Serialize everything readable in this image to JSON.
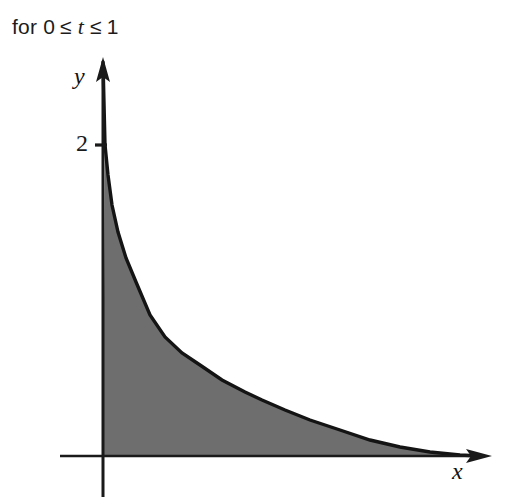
{
  "caption": {
    "prefix": "for 0",
    "rel1": "≤",
    "variable": "t",
    "rel2": "≤",
    "upper": "1",
    "full_text": "for 0 ≤ t ≤ 1"
  },
  "axes": {
    "y_label": "y",
    "x_label": "x",
    "y_tick_label": "2",
    "origin_px": [
      103,
      456
    ],
    "y_axis_top_px": 60,
    "y_axis_bottom_px": 497,
    "x_axis_right_px": 490,
    "y_tick_value": 2,
    "y_tick_px": 145
  },
  "colors": {
    "axis": "#1a1a1a",
    "curve": "#141414",
    "fill": "#6e6e6e",
    "background": "#ffffff",
    "text": "#1c1c1c"
  },
  "chart_data": {
    "type": "area",
    "title": "",
    "subtitle": "",
    "xlabel": "x",
    "ylabel": "y",
    "annotations": [
      "for 0 ≤ t ≤ 1"
    ],
    "grid": false,
    "legend": null,
    "y_ticks": [
      2
    ],
    "x_ticks": [],
    "shaded_region": true,
    "shade_color": "#6e6e6e",
    "curve_description": "decreasing convex hyperbolic-type curve from y=2 at x=0, asymptotic to the x-axis",
    "x": [
      0,
      0.08,
      0.16,
      0.25,
      0.35,
      0.45,
      0.6,
      0.75,
      0.95,
      1.2,
      1.5,
      1.9,
      2.4,
      3.0,
      3.7,
      4.5,
      5.4,
      6.4,
      7.5,
      8.7,
      10.0
    ],
    "y": [
      2.0,
      1.62,
      1.34,
      1.12,
      0.95,
      0.82,
      0.68,
      0.58,
      0.48,
      0.39,
      0.31,
      0.245,
      0.19,
      0.15,
      0.115,
      0.09,
      0.07,
      0.052,
      0.038,
      0.025,
      0.012
    ],
    "curve_points_px": [
      [
        105,
        145
      ],
      [
        108,
        175
      ],
      [
        112,
        205
      ],
      [
        118,
        232
      ],
      [
        126,
        258
      ],
      [
        136,
        282
      ],
      [
        150,
        315
      ],
      [
        165,
        337
      ],
      [
        182,
        353
      ],
      [
        200,
        365
      ],
      [
        222,
        380
      ],
      [
        245,
        392
      ],
      [
        262,
        400
      ],
      [
        285,
        410
      ],
      [
        310,
        420
      ],
      [
        340,
        430
      ],
      [
        370,
        440
      ],
      [
        400,
        447
      ],
      [
        430,
        452
      ],
      [
        460,
        455
      ],
      [
        480,
        456
      ]
    ],
    "xlim": [
      0,
      10
    ],
    "ylim": [
      0,
      2.3
    ]
  }
}
